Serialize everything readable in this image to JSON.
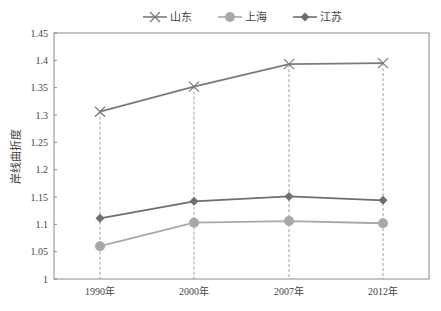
{
  "chart_data": {
    "type": "line",
    "title": "",
    "xlabel": "",
    "ylabel": "岸线曲折度",
    "categories": [
      "1990年",
      "2000年",
      "2007年",
      "2012年"
    ],
    "ylim": [
      1,
      1.45
    ],
    "yticks": [
      "1",
      "1.05",
      "1.1",
      "1.15",
      "1.2",
      "1.25",
      "1.3",
      "1.35",
      "1.4",
      "1.45"
    ],
    "grid": false,
    "vertical_dropline": true,
    "legend_position": "top",
    "series": [
      {
        "name": "山东",
        "marker": "x",
        "color": "#7a7a7a",
        "values": [
          1.306,
          1.352,
          1.393,
          1.395
        ]
      },
      {
        "name": "上海",
        "marker": "circle",
        "color": "#a8a8a8",
        "values": [
          1.06,
          1.103,
          1.106,
          1.102
        ]
      },
      {
        "name": "江苏",
        "marker": "diamond",
        "color": "#6e6e6e",
        "values": [
          1.111,
          1.142,
          1.151,
          1.144
        ]
      }
    ]
  },
  "legend": {
    "items": [
      "山东",
      "上海",
      "江苏"
    ]
  },
  "axes": {
    "y_title": "岸线曲折度"
  }
}
